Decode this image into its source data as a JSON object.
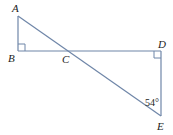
{
  "diagram": {
    "type": "geometry",
    "points": {
      "A": {
        "label": "A",
        "x": 18,
        "y": 16
      },
      "B": {
        "label": "B",
        "x": 18,
        "y": 51
      },
      "C": {
        "label": "C",
        "x": 69,
        "y": 51
      },
      "D": {
        "label": "D",
        "x": 161,
        "y": 51
      },
      "E": {
        "label": "E",
        "x": 161,
        "y": 116
      }
    },
    "segments": [
      "AB",
      "BD",
      "DE",
      "AE"
    ],
    "right_angles": [
      "B",
      "D"
    ],
    "angle_labels": [
      {
        "vertex": "E",
        "text": "54°"
      }
    ],
    "line_color": "#6f86a8"
  }
}
